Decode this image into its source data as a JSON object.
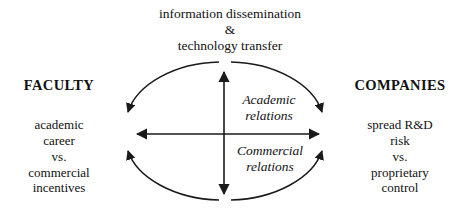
{
  "diagram": {
    "title_block": {
      "lines": [
        "information dissemination",
        "&",
        "technology transfer"
      ]
    },
    "left_actor": {
      "heading": "FACULTY",
      "tension_lines": [
        "academic",
        "career",
        "vs.",
        "commercial",
        "incentives"
      ]
    },
    "right_actor": {
      "heading": "COMPANIES",
      "tension_lines": [
        "spread R&D",
        "risk",
        "vs.",
        "proprietary",
        "control"
      ]
    },
    "relations": {
      "upper": {
        "lines": [
          "Academic",
          "relations"
        ]
      },
      "lower": {
        "lines": [
          "Commercial",
          "relations"
        ]
      }
    },
    "style": {
      "stroke_color": "#1a1a1a",
      "background_color": "#ffffff",
      "text_color": "#111111"
    }
  }
}
